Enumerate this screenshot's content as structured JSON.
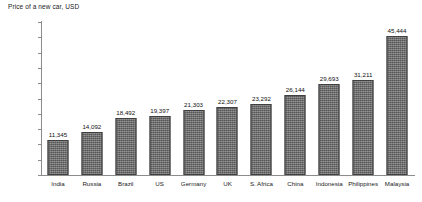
{
  "chart_data": {
    "type": "bar",
    "title": "Price of a new car, USD",
    "xlabel": "",
    "ylabel": "",
    "ylim": [
      0,
      50000
    ],
    "ytick_step": 5000,
    "grid": false,
    "legend": false,
    "bar_color": "#6e6e6e",
    "axis_color": "#8c8c8c",
    "categories": [
      "India",
      "Russia",
      "Brazil",
      "US",
      "Germany",
      "UK",
      "S. Africa",
      "China",
      "Indonesia",
      "Philippines",
      "Malaysia"
    ],
    "values": [
      11345,
      14092,
      18492,
      19397,
      21303,
      22307,
      23292,
      26144,
      29693,
      31211,
      45444
    ],
    "value_labels": [
      "11,345",
      "14,092",
      "18,492",
      "19,397",
      "21,303",
      "22,307",
      "23,292",
      "26,144",
      "29,693",
      "31,211",
      "45,444"
    ],
    "ytick_labels": [
      "0",
      "5,000",
      "10,000",
      "15,000",
      "20,000",
      "25,000",
      "30,000",
      "35,000",
      "40,000",
      "45,000",
      "50,000"
    ],
    "ytick_values": [
      0,
      5000,
      10000,
      15000,
      20000,
      25000,
      30000,
      35000,
      40000,
      45000,
      50000
    ]
  }
}
